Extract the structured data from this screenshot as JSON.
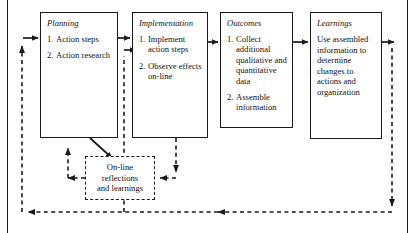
{
  "diagram": {
    "stages": [
      {
        "name": "planning",
        "title": "Planning",
        "items": [
          {
            "num": "1.",
            "text": "Action steps"
          },
          {
            "num": "2.",
            "text": "Action research"
          }
        ]
      },
      {
        "name": "implementation",
        "title": "Implementation",
        "items": [
          {
            "num": "1.",
            "text": "Implement action steps"
          },
          {
            "num": "2.",
            "text": "Observe effects on-line"
          }
        ]
      },
      {
        "name": "outcomes",
        "title": "Outcomes",
        "items": [
          {
            "num": "1.",
            "text": "Collect additional qualitative and quantitative data"
          },
          {
            "num": "2.",
            "text": "Assemble information"
          }
        ]
      },
      {
        "name": "learnings",
        "title": "Learnings",
        "body": "Use assembled information to determine changes to actions and organization"
      }
    ],
    "feedback_box": {
      "name": "on-line-reflections",
      "line1": "On-line",
      "line2": "reflections",
      "line3": "and learnings"
    },
    "colors": {
      "stroke": "#1a1a1a",
      "background": "#ffffff",
      "text": "#111111"
    }
  }
}
